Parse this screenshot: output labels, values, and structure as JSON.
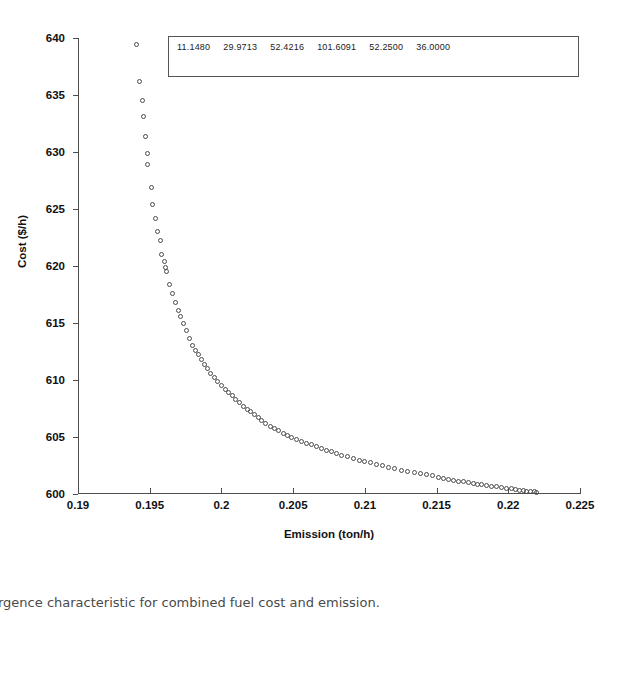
{
  "caption": {
    "text": "rgence characteristic for combined fuel cost and emission.",
    "full_text_note": "Convergence characteristic for combined fuel cost and emission."
  },
  "legend": {
    "values": [
      "11.1480",
      "29.9713",
      "52.4216",
      "101.6091",
      "52.2500",
      "36.0000"
    ]
  },
  "colors": {
    "axis": "#4d4d4d",
    "marker_stroke": "#4a4a4a",
    "text": "#111111",
    "caption": "#4a4a4a",
    "background": "#ffffff",
    "legend_border": "#555555"
  },
  "chart_data": {
    "type": "scatter",
    "title": "",
    "subtitle": "",
    "xlabel": "Emission (ton/h)",
    "ylabel": "Cost ($/h)",
    "xlim": [
      0.19,
      0.225
    ],
    "ylim": [
      600,
      640
    ],
    "xticks": [
      0.19,
      0.195,
      0.2,
      0.205,
      0.21,
      0.215,
      0.22,
      0.225
    ],
    "xticklabels": [
      "0.19",
      "0.195",
      "0.2",
      "0.205",
      "0.21",
      "0.215",
      "0.22",
      "0.225"
    ],
    "yticks": [
      600,
      605,
      610,
      615,
      620,
      625,
      630,
      635,
      640
    ],
    "yticklabels": [
      "600",
      "605",
      "610",
      "615",
      "620",
      "625",
      "630",
      "635",
      "640"
    ],
    "grid": false,
    "legend_position": "top-inside",
    "marker": "open-circle",
    "marker_size": 5,
    "annotations": [
      {
        "type": "text-box",
        "position": "top-center",
        "text": "11.1480   29.9713   52.4216  101.6091   52.2500   36.0000"
      }
    ],
    "series": [
      {
        "name": "Pareto front",
        "x": [
          0.1941,
          0.1943,
          0.19448,
          0.19455,
          0.1947,
          0.19482,
          0.19488,
          0.1951,
          0.19522,
          0.1954,
          0.19555,
          0.19572,
          0.19585,
          0.196,
          0.19612,
          0.19618,
          0.1964,
          0.1966,
          0.1968,
          0.197,
          0.19715,
          0.19735,
          0.19755,
          0.19778,
          0.198,
          0.1982,
          0.1984,
          0.1986,
          0.1988,
          0.199,
          0.19925,
          0.1995,
          0.19975,
          0.2,
          0.20025,
          0.2005,
          0.20075,
          0.201,
          0.20128,
          0.20155,
          0.2018,
          0.20205,
          0.2023,
          0.20255,
          0.2028,
          0.2031,
          0.2034,
          0.2037,
          0.204,
          0.2043,
          0.2046,
          0.2049,
          0.2052,
          0.20555,
          0.2059,
          0.20625,
          0.2066,
          0.20695,
          0.2073,
          0.20765,
          0.208,
          0.2084,
          0.2088,
          0.2092,
          0.2096,
          0.21,
          0.2104,
          0.2108,
          0.2112,
          0.21165,
          0.2121,
          0.21255,
          0.213,
          0.21345,
          0.2139,
          0.2143,
          0.2147,
          0.2151,
          0.2155,
          0.21585,
          0.2162,
          0.21655,
          0.2169,
          0.21725,
          0.21755,
          0.21785,
          0.21815,
          0.2185,
          0.21885,
          0.2192,
          0.21955,
          0.2199,
          0.2202,
          0.2205,
          0.2208,
          0.22105,
          0.2213,
          0.22155,
          0.2218,
          0.222
        ],
        "y": [
          639.4,
          636.2,
          634.5,
          633.1,
          631.4,
          629.9,
          628.9,
          626.9,
          625.4,
          624.2,
          623.0,
          622.2,
          621.0,
          620.4,
          619.9,
          619.5,
          618.4,
          617.6,
          616.8,
          616.1,
          615.6,
          615.0,
          614.3,
          613.6,
          613.0,
          612.6,
          612.2,
          611.8,
          611.4,
          611.0,
          610.6,
          610.2,
          609.85,
          609.5,
          609.2,
          608.9,
          608.6,
          608.3,
          608.0,
          607.7,
          607.45,
          607.2,
          606.95,
          606.7,
          606.45,
          606.2,
          605.95,
          605.75,
          605.55,
          605.35,
          605.15,
          604.95,
          604.8,
          604.6,
          604.45,
          604.3,
          604.15,
          604.0,
          603.85,
          603.7,
          603.55,
          603.4,
          603.25,
          603.1,
          602.98,
          602.85,
          602.72,
          602.6,
          602.48,
          602.35,
          602.22,
          602.1,
          601.98,
          601.88,
          601.78,
          601.68,
          601.58,
          601.48,
          601.38,
          601.3,
          601.22,
          601.14,
          601.06,
          600.98,
          600.92,
          600.86,
          600.8,
          600.74,
          600.68,
          600.62,
          600.56,
          600.5,
          600.45,
          600.4,
          600.35,
          600.3,
          600.26,
          600.22,
          600.18,
          600.15
        ]
      }
    ]
  }
}
